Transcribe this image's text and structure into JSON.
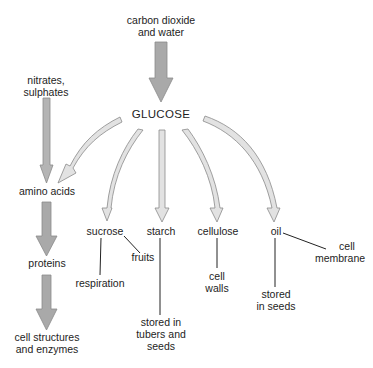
{
  "diagram": {
    "colors": {
      "dark_arrow_fill": "#a9a9a9",
      "light_arrow_fill": "#e2e2e2",
      "arrow_stroke": "#8a8a8a",
      "line": "#222222",
      "text": "#1d1d1d"
    },
    "nodes": {
      "carbon_dioxide": "carbon dioxide",
      "and_water": "and water",
      "glucose": "GLUCOSE",
      "nitrates": "nitrates,",
      "sulphates": "sulphates",
      "amino_acids": "amino acids",
      "proteins": "proteins",
      "cell_structures_1": "cell structures",
      "cell_structures_2": "and enzymes",
      "sucrose": "sucrose",
      "starch": "starch",
      "cellulose": "cellulose",
      "oil": "oil",
      "fruits": "fruits",
      "respiration": "respiration",
      "stored_tubers_1": "stored in",
      "stored_tubers_2": "tubers and",
      "stored_tubers_3": "seeds",
      "cell_walls_1": "cell",
      "cell_walls_2": "walls",
      "stored_seeds_1": "stored",
      "stored_seeds_2": "in seeds",
      "cell_membrane_1": "cell",
      "cell_membrane_2": "membrane"
    },
    "edges": [
      {
        "from": "carbon dioxide and water",
        "to": "GLUCOSE",
        "style": "dark-arrow"
      },
      {
        "from": "nitrates, sulphates",
        "to": "amino acids",
        "style": "dark-arrow"
      },
      {
        "from": "GLUCOSE",
        "to": "amino acids",
        "style": "light-arrow"
      },
      {
        "from": "amino acids",
        "to": "proteins",
        "style": "dark-arrow"
      },
      {
        "from": "proteins",
        "to": "cell structures and enzymes",
        "style": "dark-arrow"
      },
      {
        "from": "GLUCOSE",
        "to": "sucrose",
        "style": "light-arrow"
      },
      {
        "from": "GLUCOSE",
        "to": "starch",
        "style": "light-arrow"
      },
      {
        "from": "GLUCOSE",
        "to": "cellulose",
        "style": "light-arrow"
      },
      {
        "from": "GLUCOSE",
        "to": "oil",
        "style": "light-arrow"
      },
      {
        "from": "sucrose",
        "to": "respiration",
        "style": "line"
      },
      {
        "from": "sucrose",
        "to": "fruits",
        "style": "line"
      },
      {
        "from": "starch",
        "to": "stored in tubers and seeds",
        "style": "line"
      },
      {
        "from": "cellulose",
        "to": "cell walls",
        "style": "line"
      },
      {
        "from": "oil",
        "to": "stored in seeds",
        "style": "line"
      },
      {
        "from": "oil",
        "to": "cell membrane",
        "style": "line"
      }
    ]
  }
}
